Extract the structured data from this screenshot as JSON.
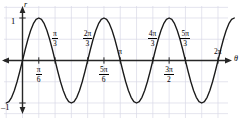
{
  "figure": {
    "title": "",
    "axis_labels": {
      "x": "θ",
      "y": "r"
    },
    "y_ticks": [
      {
        "label": "1",
        "value": 1
      },
      {
        "label": "–1",
        "value": -1
      }
    ],
    "x_ticks_above": [
      {
        "num": "π",
        "den": "3",
        "value_pi": 0.3333,
        "label": "π/3"
      },
      {
        "num": "2π",
        "den": "3",
        "value_pi": 0.6667,
        "label": "2π/3"
      },
      {
        "num": "π",
        "den": "",
        "value_pi": 1.0,
        "label": "π"
      },
      {
        "num": "4π",
        "den": "3",
        "value_pi": 1.3333,
        "label": "4π/3"
      },
      {
        "num": "5π",
        "den": "3",
        "value_pi": 1.6667,
        "label": "5π/3"
      },
      {
        "num": "2π",
        "den": "",
        "value_pi": 2.0,
        "label": "2π"
      }
    ],
    "x_ticks_below": [
      {
        "num": "π",
        "den": "6",
        "value_pi": 0.1667,
        "label": "π/6"
      },
      {
        "num": "5π",
        "den": "6",
        "value_pi": 0.8333,
        "label": "5π/6"
      },
      {
        "num": "3π",
        "den": "2",
        "value_pi": 1.5,
        "label": "3π/2"
      }
    ],
    "colors": {
      "curve": "#1a1a1a",
      "axis": "#262626",
      "grid": "#d9d9e6",
      "background": "#ffffff"
    }
  },
  "chart_data": {
    "type": "line",
    "title": "",
    "subtitle": "",
    "xlabel": "θ",
    "ylabel": "r",
    "equation": "r = sin(3θ)",
    "grid": true,
    "legend": "none",
    "xlim": [
      -0.1667,
      2.1667
    ],
    "ylim": [
      -1.25,
      1.25
    ],
    "xtick_labels": [
      "π/6",
      "π/3",
      "2π/3",
      "5π/6",
      "π",
      "4π/3",
      "3π/2",
      "5π/3",
      "2π"
    ],
    "xtick_values_pi": [
      0.1667,
      0.3333,
      0.6667,
      0.8333,
      1.0,
      1.3333,
      1.5,
      1.6667,
      2.0
    ],
    "ytick_labels": [
      "1",
      "–1"
    ],
    "ytick_values": [
      1,
      -1
    ],
    "series": [
      {
        "name": "r = sin(3θ)",
        "color": "#1a1a1a",
        "x_pi": [
          -0.1667,
          -0.1389,
          -0.1111,
          -0.0833,
          -0.0556,
          -0.0278,
          0.0,
          0.0278,
          0.0556,
          0.0833,
          0.1111,
          0.1389,
          0.1667,
          0.1944,
          0.2222,
          0.25,
          0.2778,
          0.3056,
          0.3333,
          0.3611,
          0.3889,
          0.4167,
          0.4444,
          0.4722,
          0.5,
          0.5278,
          0.5556,
          0.5833,
          0.6111,
          0.6389,
          0.6667,
          0.6944,
          0.7222,
          0.75,
          0.7778,
          0.8056,
          0.8333,
          0.8611,
          0.8889,
          0.9167,
          0.9444,
          0.9722,
          1.0,
          1.0278,
          1.0556,
          1.0833,
          1.1111,
          1.1389,
          1.1667,
          1.1944,
          1.2222,
          1.25,
          1.2778,
          1.3056,
          1.3333,
          1.3611,
          1.3889,
          1.4167,
          1.4444,
          1.4722,
          1.5,
          1.5278,
          1.5556,
          1.5833,
          1.6111,
          1.6389,
          1.6667,
          1.6944,
          1.7222,
          1.75,
          1.7778,
          1.8056,
          1.8333,
          1.8611,
          1.8889,
          1.9167,
          1.9444,
          1.9722,
          2.0,
          2.0278,
          2.0556,
          2.0833,
          2.1111,
          2.1389,
          2.1667
        ],
        "y": [
          -1.0,
          -0.966,
          -0.866,
          -0.707,
          -0.5,
          -0.259,
          0.0,
          0.259,
          0.5,
          0.707,
          0.866,
          0.966,
          1.0,
          0.966,
          0.866,
          0.707,
          0.5,
          0.259,
          0.0,
          -0.259,
          -0.5,
          -0.707,
          -0.866,
          -0.966,
          -1.0,
          -0.966,
          -0.866,
          -0.707,
          -0.5,
          -0.259,
          0.0,
          0.259,
          0.5,
          0.707,
          0.866,
          0.966,
          1.0,
          0.966,
          0.866,
          0.707,
          0.5,
          0.259,
          0.0,
          -0.259,
          -0.5,
          -0.707,
          -0.866,
          -0.966,
          -1.0,
          -0.966,
          -0.866,
          -0.707,
          -0.5,
          -0.259,
          0.0,
          0.259,
          0.5,
          0.707,
          0.866,
          0.966,
          1.0,
          0.966,
          0.866,
          0.707,
          0.5,
          0.259,
          0.0,
          -0.259,
          -0.5,
          -0.707,
          -0.866,
          -0.966,
          -1.0,
          -0.966,
          -0.866,
          -0.707,
          -0.5,
          -0.259,
          0.0,
          0.259,
          0.5,
          0.707,
          0.866,
          0.966,
          1.0
        ]
      }
    ],
    "annotations": []
  }
}
